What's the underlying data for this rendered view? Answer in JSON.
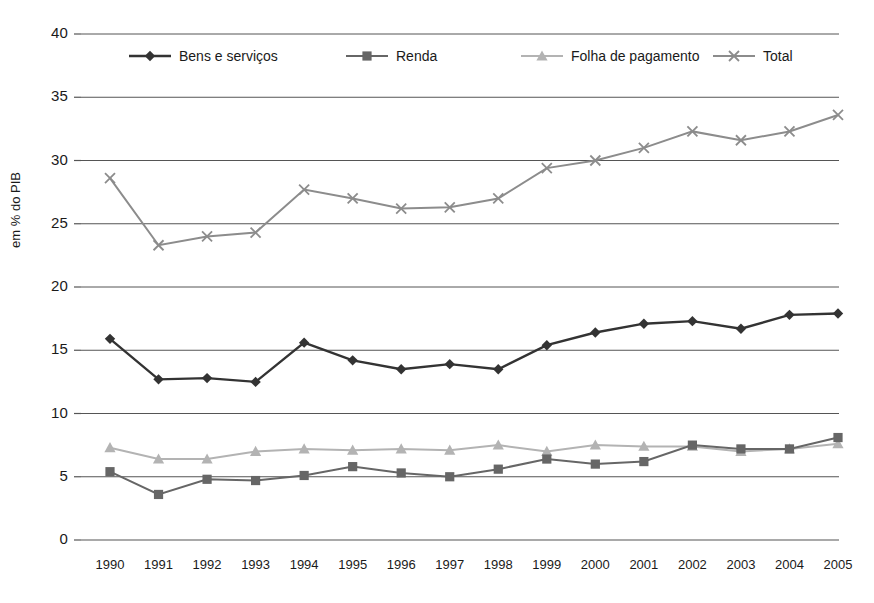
{
  "chart_data": {
    "type": "line",
    "title": "",
    "xlabel": "",
    "ylabel": "em % do PIB",
    "categories": [
      "1990",
      "1991",
      "1992",
      "1993",
      "1994",
      "1995",
      "1996",
      "1997",
      "1998",
      "1999",
      "2000",
      "2001",
      "2002",
      "2003",
      "2004",
      "2005"
    ],
    "ylim": [
      0,
      40
    ],
    "ytick_values": [
      0,
      5,
      10,
      15,
      20,
      25,
      30,
      35,
      40
    ],
    "ytick_labels": [
      "0",
      "5",
      "10",
      "15",
      "20",
      "25",
      "30",
      "35",
      "40"
    ],
    "grid": true,
    "legend_position": "top-inside",
    "series": [
      {
        "name": "Bens e serviços",
        "marker": "diamond",
        "color": "#333333",
        "values": [
          15.9,
          12.7,
          12.8,
          12.5,
          15.6,
          14.2,
          13.5,
          13.9,
          13.5,
          15.4,
          16.4,
          17.1,
          17.3,
          16.7,
          17.8,
          17.9
        ]
      },
      {
        "name": "Renda",
        "marker": "square",
        "color": "#666666",
        "values": [
          5.4,
          3.6,
          4.8,
          4.7,
          5.1,
          5.8,
          5.3,
          5.0,
          5.6,
          6.4,
          6.0,
          6.2,
          7.5,
          7.2,
          7.2,
          8.1
        ]
      },
      {
        "name": "Folha de pagamento",
        "marker": "triangle",
        "color": "#b3b3b3",
        "values": [
          7.3,
          6.4,
          6.4,
          7.0,
          7.2,
          7.1,
          7.2,
          7.1,
          7.5,
          7.0,
          7.5,
          7.4,
          7.4,
          7.0,
          7.2,
          7.6
        ]
      },
      {
        "name": "Total",
        "marker": "cross",
        "color": "#8c8c8c",
        "values": [
          28.6,
          23.3,
          24.0,
          24.3,
          27.7,
          27.0,
          26.2,
          26.3,
          27.0,
          29.4,
          30.0,
          31.0,
          32.3,
          31.6,
          32.3,
          33.6
        ]
      }
    ]
  },
  "axes": {
    "y_axis_title": "em % do PIB"
  },
  "colors": {
    "gridline": "#555555",
    "text": "#1a1a1a",
    "background": "#ffffff"
  }
}
